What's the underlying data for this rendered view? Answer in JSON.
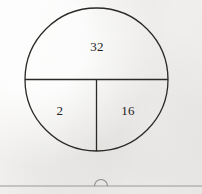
{
  "figure": {
    "kind": "circle-partition-diagram",
    "background_color": "#f2f1ef",
    "stroke_color": "#2b2825",
    "text_color": "#23211f",
    "circle": {
      "center_x": 96.5,
      "center_y": 79.5,
      "radius": 71.5
    },
    "divider_horizontal": {
      "label": "horizontal-diameter",
      "x1": 25,
      "y1": 79.5,
      "x2": 168,
      "y2": 79.5
    },
    "divider_vertical": {
      "label": "vertical-radius",
      "x1": 96.5,
      "y1": 79.5,
      "x2": 96.5,
      "y2": 151
    },
    "regions": [
      {
        "name": "top-half",
        "value": "32",
        "x": 97,
        "y": 46
      },
      {
        "name": "bottom-left-quarter",
        "value": "2",
        "x": 60,
        "y": 110
      },
      {
        "name": "bottom-right-quarter",
        "value": "16",
        "x": 128,
        "y": 110
      }
    ]
  },
  "page_footer": {
    "rule": {
      "name": "footer-rule",
      "y": 186,
      "x1": 0,
      "x2": 202,
      "color": "#9b9a98"
    },
    "arc_marker": {
      "name": "semicircle-marker",
      "center_x": 101,
      "radius": 6.5,
      "color": "#8f8e8c"
    }
  }
}
